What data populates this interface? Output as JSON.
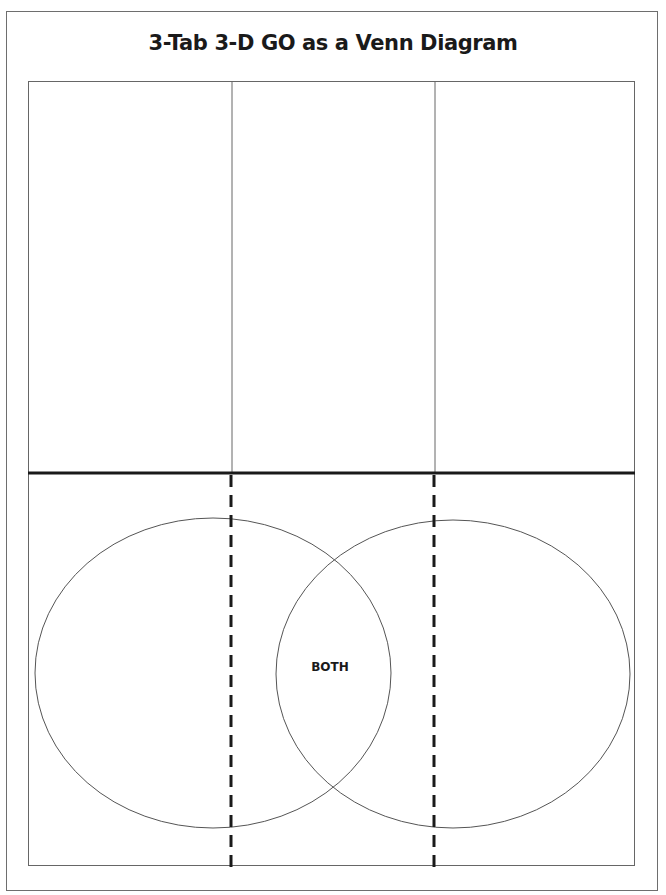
{
  "title": "3-Tab 3-D GO as a Venn Diagram",
  "top_tabs": [
    {
      "label": "",
      "position": "left"
    },
    {
      "label": "",
      "position": "middle"
    },
    {
      "label": "",
      "position": "right"
    }
  ],
  "venn": {
    "left_circle_label": "",
    "right_circle_label": "",
    "overlap_label": "BOTH"
  },
  "colors": {
    "line": "#555555",
    "thick_line": "#1a1a1a",
    "text": "#1a1a1a",
    "background": "#ffffff"
  }
}
